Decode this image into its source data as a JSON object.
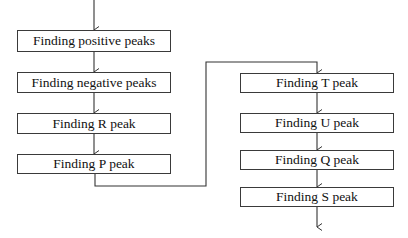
{
  "diagram": {
    "type": "flowchart",
    "line_color": "#333333",
    "left_column": [
      {
        "id": "positive",
        "label": "Finding positive peaks"
      },
      {
        "id": "negative",
        "label": "Finding negative peaks"
      },
      {
        "id": "r",
        "label": "Finding R peak"
      },
      {
        "id": "p",
        "label": "Finding P peak"
      }
    ],
    "right_column": [
      {
        "id": "t",
        "label": "Finding T peak"
      },
      {
        "id": "u",
        "label": "Finding U peak"
      },
      {
        "id": "q",
        "label": "Finding Q peak"
      },
      {
        "id": "s",
        "label": "Finding S peak"
      }
    ],
    "edges": [
      [
        "start",
        "positive"
      ],
      [
        "positive",
        "negative"
      ],
      [
        "negative",
        "r"
      ],
      [
        "r",
        "p"
      ],
      [
        "p",
        "t"
      ],
      [
        "t",
        "u"
      ],
      [
        "u",
        "q"
      ],
      [
        "q",
        "s"
      ],
      [
        "s",
        "end"
      ]
    ]
  }
}
